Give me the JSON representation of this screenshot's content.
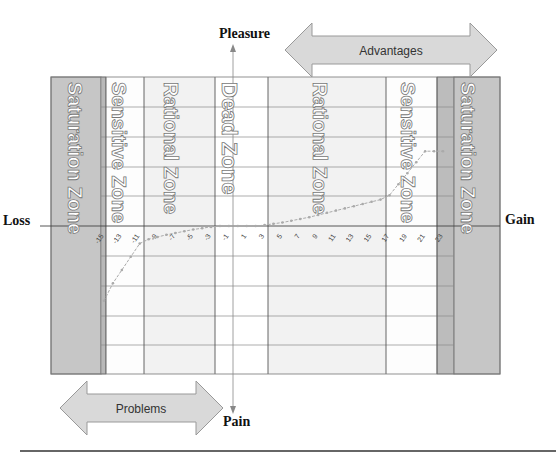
{
  "axes": {
    "top_label": "Pleasure",
    "bottom_label": "Pain",
    "left_label": "Loss",
    "right_label": "Gain"
  },
  "arrows": {
    "top": "Advantages",
    "bottom": "Problems"
  },
  "zones": [
    {
      "name": "Saturation Zone",
      "side": "left"
    },
    {
      "name": "Sensitive Zone",
      "side": "left"
    },
    {
      "name": "Rational Zone",
      "side": "left"
    },
    {
      "name": "Dead Zone",
      "side": "center"
    },
    {
      "name": "Rational Zone",
      "side": "right"
    },
    {
      "name": "Sensitive Zone",
      "side": "right"
    },
    {
      "name": "Saturation Zone",
      "side": "right"
    }
  ],
  "x_ticks": [
    "-15",
    "-13",
    "-11",
    "-9",
    "-7",
    "-5",
    "-3",
    "-1",
    "1",
    "3",
    "5",
    "7",
    "9",
    "11",
    "13",
    "15",
    "17",
    "19",
    "21",
    "23"
  ],
  "colors": {
    "saturation": "#c6c6c6",
    "saturation_band": "#b4b4b4",
    "rational": "#f3f3f3",
    "sensitive": "#ffffff",
    "dead": "#ffffff",
    "curve": "#aaaaaa",
    "arrow_fill": "#d9d9d9",
    "arrow_stroke": "#9a9a9a"
  },
  "chart_data": {
    "type": "line",
    "title": "",
    "xlabel": "Gain / Loss",
    "ylabel": "Pleasure / Pain",
    "x": [
      -15,
      -14,
      -13,
      -12,
      -11,
      -10,
      -9,
      -8,
      -7,
      -6,
      -5,
      -4,
      -3,
      -2,
      -1,
      0,
      1,
      2,
      3,
      4,
      5,
      6,
      7,
      8,
      9,
      10,
      11,
      12,
      13,
      14,
      15,
      16,
      17,
      18,
      19,
      20,
      21,
      22,
      23
    ],
    "values": [
      -3.4,
      -2.6,
      -2.0,
      -1.4,
      -0.8,
      -0.6,
      -0.5,
      -0.4,
      -0.32,
      -0.24,
      -0.16,
      -0.1,
      -0.04,
      0,
      0,
      0,
      0,
      0,
      0.04,
      0.1,
      0.16,
      0.24,
      0.32,
      0.4,
      0.5,
      0.6,
      0.7,
      0.8,
      0.9,
      1.0,
      1.1,
      1.2,
      1.4,
      1.9,
      2.4,
      2.9,
      3.4,
      3.4,
      3.4
    ],
    "grid": true
  }
}
